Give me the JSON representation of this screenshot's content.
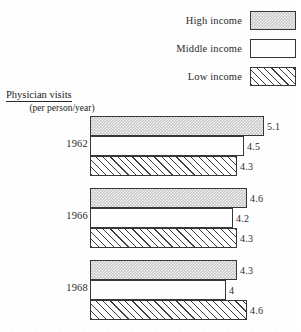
{
  "legend": {
    "items": [
      {
        "label": "High income",
        "pattern": "stipple"
      },
      {
        "label": "Middle income",
        "pattern": "white"
      },
      {
        "label": "Low income",
        "pattern": "hatch"
      }
    ]
  },
  "axis_label": {
    "main": "Physician visits",
    "sub": "(per person/year)"
  },
  "chart_data": {
    "type": "bar",
    "orientation": "horizontal",
    "title": "",
    "xlabel": "Physician visits (per person/year)",
    "ylabel": "",
    "categories": [
      "1962",
      "1966",
      "1968"
    ],
    "series": [
      {
        "name": "High income",
        "values": [
          5.1,
          4.6,
          4.3
        ]
      },
      {
        "name": "Middle income",
        "values": [
          4.5,
          4.2,
          4.0
        ]
      },
      {
        "name": "Low income",
        "values": [
          4.3,
          4.3,
          4.6
        ]
      }
    ],
    "value_labels": [
      [
        "5.1",
        "4.5",
        "4.3"
      ],
      [
        "4.6",
        "4.2",
        "4.3"
      ],
      [
        "4.3",
        "4",
        "4.6"
      ]
    ],
    "xlim": [
      0,
      5.1
    ],
    "grid": false,
    "legend_position": "top-right"
  }
}
